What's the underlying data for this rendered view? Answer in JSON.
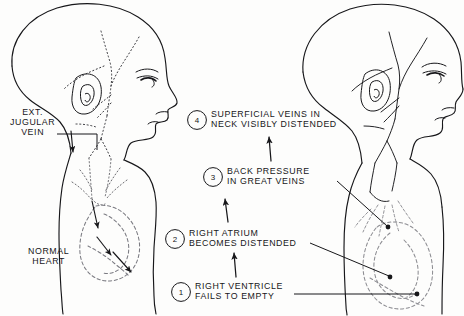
{
  "figure": {
    "background_color": "#fdfdfc",
    "ink_color": "#17171a",
    "faint_ink_color": "#8d8d92"
  },
  "left_panel": {
    "name": "normal-circulation-figure",
    "labels": [
      {
        "id": "ext-jugular-vein",
        "text": "EXT.\nJUGULAR\nVEIN",
        "x": 10,
        "y": 108
      },
      {
        "id": "normal-heart",
        "text": "NORMAL\nHEART",
        "x": 28,
        "y": 247
      }
    ]
  },
  "right_panel": {
    "name": "right-heart-failure-figure",
    "callouts": [
      {
        "number": "4",
        "id": "callout-superficial-veins",
        "text": "SUPERFICIAL VEINS IN\nNECK VISIBLY DISTENDED",
        "circle_x": 197,
        "circle_y": 120,
        "text_x": 211,
        "text_y": 110
      },
      {
        "number": "3",
        "id": "callout-back-pressure",
        "text": "BACK PRESSURE\nIN GREAT VEINS",
        "circle_x": 213,
        "circle_y": 177,
        "text_x": 227,
        "text_y": 167
      },
      {
        "number": "2",
        "id": "callout-right-atrium",
        "text": "RIGHT ATRIUM\nBECOMES DISTENDED",
        "circle_x": 175,
        "circle_y": 239,
        "text_x": 189,
        "text_y": 229
      },
      {
        "number": "1",
        "id": "callout-right-ventricle",
        "text": "RIGHT VENTRICLE\nFAILS TO EMPTY",
        "circle_x": 181,
        "circle_y": 292,
        "text_x": 195,
        "text_y": 282
      }
    ]
  }
}
